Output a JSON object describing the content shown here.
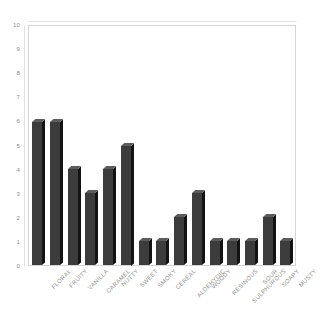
{
  "chart_data": {
    "type": "bar",
    "title": "",
    "subtitle": "",
    "xlabel": "",
    "ylabel": "",
    "ylim": [
      0,
      10
    ],
    "ytick_labels": [
      "10",
      "9",
      "8",
      "7",
      "6",
      "5",
      "4",
      "3",
      "2",
      "1",
      "0"
    ],
    "yticks": [
      10,
      9,
      8,
      7,
      6,
      5,
      4,
      3,
      2,
      1,
      0
    ],
    "grid": false,
    "legend": null,
    "legend_position": "none",
    "categories": [
      "FLORAL",
      "FRUITY",
      "VANILLA",
      "CARAMEL",
      "NUTTY",
      "SWEET",
      "SMOKY",
      "CEREAL",
      "ALDEHYDIC",
      "WOODY",
      "RESINOUS",
      "SULPHUROUS",
      "SOUR",
      "SOAPY",
      "MUSTY"
    ],
    "values": [
      6,
      6,
      4,
      3,
      4,
      5,
      1,
      1,
      2,
      3,
      1,
      1,
      1,
      2,
      1
    ],
    "colors": {
      "bar_face": "#3c3c3c",
      "bar_side": "#131313",
      "bar_top": "#5c5c5c",
      "frame": "#d6d6d6",
      "tick_text": "#8a8a8a",
      "category_text": "#8f8f8f",
      "background": "#ffffff"
    }
  }
}
